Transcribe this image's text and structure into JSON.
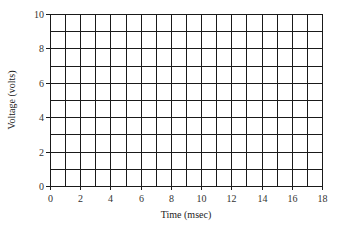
{
  "chart_data": {
    "type": "line",
    "title": "",
    "xlabel": "Time (msec)",
    "ylabel": "Voltage (volts)",
    "xlim": [
      0,
      18
    ],
    "ylim": [
      0,
      10
    ],
    "x_ticks": [
      0,
      2,
      4,
      6,
      8,
      10,
      12,
      14,
      16,
      18
    ],
    "y_ticks": [
      0,
      2,
      4,
      6,
      8,
      10
    ],
    "x_grid_step": 1,
    "y_grid_step": 1,
    "grid": true,
    "legend": null,
    "series": []
  },
  "layout": {
    "plot_left": 50,
    "plot_top": 14,
    "plot_right": 322,
    "plot_bottom": 186,
    "grid_color": "#1a1a1a"
  }
}
